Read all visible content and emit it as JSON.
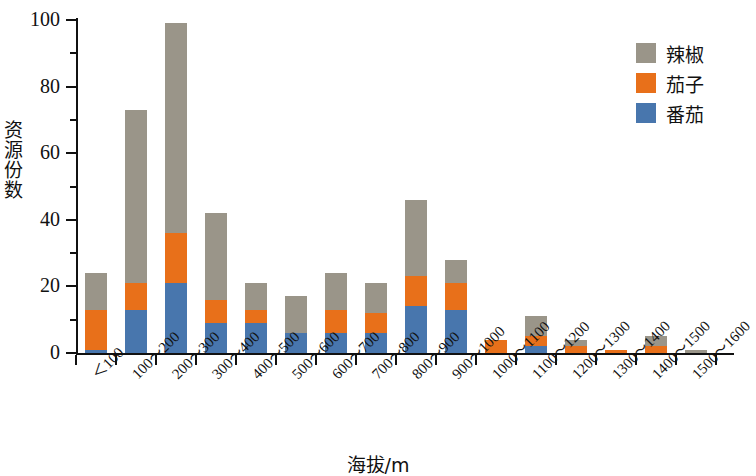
{
  "chart_data": {
    "type": "bar",
    "subtype": "stacked",
    "title": "",
    "xlabel": "海拔/m",
    "ylabel": "资源份数",
    "ylim": [
      0,
      100
    ],
    "yticks": [
      0,
      20,
      40,
      60,
      80,
      100
    ],
    "yticks_minor": [
      10,
      30,
      50,
      70,
      90
    ],
    "grid": false,
    "legend_position": "top-right",
    "categories": [
      "＜100",
      "100～200",
      "200～300",
      "300～400",
      "400～500",
      "500～600",
      "600～700",
      "700～800",
      "800～900",
      "900～1000",
      "1000～1100",
      "1100～1200",
      "1200～1300",
      "1300～1400",
      "1400～1500",
      "1500～1600"
    ],
    "series": [
      {
        "name": "番茄",
        "color": "#4876ad",
        "values": [
          1,
          13,
          21,
          9,
          9,
          6,
          6,
          6,
          14,
          13,
          0,
          2,
          0,
          0,
          0,
          0
        ]
      },
      {
        "name": "茄子",
        "color": "#e8701a",
        "values": [
          12,
          8,
          15,
          7,
          4,
          0,
          7,
          6,
          9,
          8,
          4,
          3,
          2,
          1,
          2,
          0
        ]
      },
      {
        "name": "辣椒",
        "color": "#9a9589",
        "values": [
          11,
          52,
          63,
          26,
          8,
          11,
          11,
          9,
          23,
          7,
          0,
          6,
          2,
          0,
          3,
          1
        ]
      }
    ],
    "totals": [
      24,
      73,
      99,
      42,
      21,
      17,
      24,
      21,
      46,
      28,
      4,
      11,
      4,
      1,
      5,
      1
    ]
  },
  "legend": {
    "items": [
      {
        "label": "辣椒",
        "color": "#9a9589"
      },
      {
        "label": "茄子",
        "color": "#e8701a"
      },
      {
        "label": "番茄",
        "color": "#4876ad"
      }
    ]
  },
  "axes": {
    "y_title": "资源份数",
    "x_title": "海拔/m",
    "y_tick_labels": [
      "0",
      "20",
      "40",
      "60",
      "80",
      "100"
    ]
  }
}
